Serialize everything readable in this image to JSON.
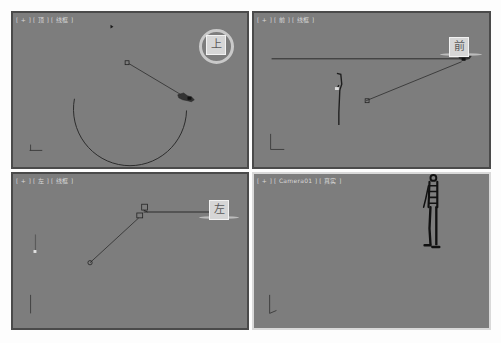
{
  "app": "3ds Max quad viewport",
  "viewports": [
    {
      "id": "top",
      "label": {
        "plus": "[ + ]",
        "view": "[ 顶 ]",
        "shading": "[ 线框 ]"
      },
      "viewcube": {
        "face": "上",
        "style": "ring"
      },
      "active": false
    },
    {
      "id": "front",
      "label": {
        "plus": "[ + ]",
        "view": "[ 前 ]",
        "shading": "[ 线框 ]"
      },
      "viewcube": {
        "face": "前",
        "style": "flat"
      },
      "active": false
    },
    {
      "id": "left",
      "label": {
        "plus": "[ + ]",
        "view": "[ 左 ]",
        "shading": "[ 线框 ]"
      },
      "viewcube": {
        "face": "左",
        "style": "flat"
      },
      "active": false
    },
    {
      "id": "camera",
      "label": {
        "plus": "[ + ]",
        "view": "[ Camera01 ]",
        "shading": "[ 真实 ]"
      },
      "viewcube": null,
      "active": true
    }
  ],
  "colors": {
    "viewport_bg": "#7d7d7d",
    "viewport_border": "#4a4a4a",
    "active_border": "#d9d9d9",
    "object_line": "#2a2a2a"
  }
}
